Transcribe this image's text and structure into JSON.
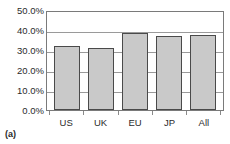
{
  "caption": "(a)",
  "chart_data": {
    "type": "bar",
    "title": "",
    "subtitle": "",
    "xlabel": "",
    "ylabel": "",
    "categories": [
      "US",
      "UK",
      "EU",
      "JP",
      "All"
    ],
    "values": [
      32.5,
      31.5,
      39.5,
      37.8,
      38.3
    ],
    "value_suffix": "%",
    "ylim": [
      0,
      50
    ],
    "ytick_values": [
      0,
      10,
      20,
      30,
      40,
      50
    ],
    "ytick_labels": [
      "0.0%",
      "10.0%",
      "20.0%",
      "30.0%",
      "40.0%",
      "50.0%"
    ],
    "grid": true,
    "grid_axis": "y",
    "legend": false,
    "legend_position": "none",
    "series": [
      {
        "name": "",
        "values": [
          32.5,
          31.5,
          39.5,
          37.8,
          38.3
        ]
      }
    ],
    "colors": {
      "bar_fill": "#c9c9c9",
      "bar_border": "#4a4a4a",
      "gridline": "#9a9a9a",
      "frame": "#7a7a7a",
      "text": "#2b2b2b",
      "background": "#ffffff"
    }
  }
}
